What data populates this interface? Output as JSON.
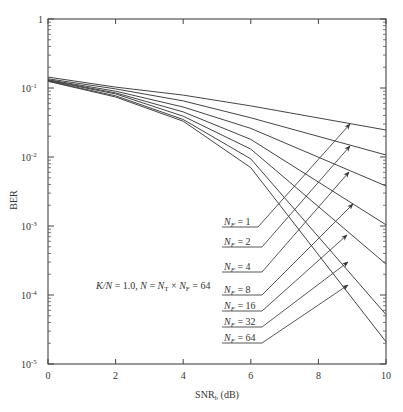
{
  "chart_data": {
    "type": "line",
    "title": "",
    "xlabel": "SNR_b (dB)",
    "xlabel_main": "SNR",
    "xlabel_sub": "b",
    "xlabel_unit": " (dB)",
    "ylabel": "BER",
    "xlim": [
      0,
      10
    ],
    "ylim": [
      1e-05,
      1
    ],
    "yscale": "log",
    "grid": false,
    "x_ticks": [
      0,
      2,
      4,
      6,
      8,
      10
    ],
    "y_ticks": [
      {
        "value": 1,
        "label": "1"
      },
      {
        "value": 0.1,
        "label": "10",
        "exp": "-1"
      },
      {
        "value": 0.01,
        "label": "10",
        "exp": "-2"
      },
      {
        "value": 0.001,
        "label": "10",
        "exp": "-3"
      },
      {
        "value": 0.0001,
        "label": "10",
        "exp": "-4"
      },
      {
        "value": 1e-05,
        "label": "10",
        "exp": "-5"
      }
    ],
    "x": [
      0,
      2,
      4,
      6,
      10
    ],
    "series": [
      {
        "name": "N_F = 1",
        "label": "1",
        "values": [
          0.144,
          0.103,
          0.079,
          0.055,
          0.0246
        ]
      },
      {
        "name": "N_F = 2",
        "label": "2",
        "values": [
          0.136,
          0.097,
          0.065,
          0.037,
          0.0107
        ]
      },
      {
        "name": "N_F = 4",
        "label": "4",
        "values": [
          0.132,
          0.09,
          0.053,
          0.026,
          0.0038
        ]
      },
      {
        "name": "N_F = 8",
        "label": "8",
        "values": [
          0.13,
          0.085,
          0.045,
          0.018,
          0.00104
        ]
      },
      {
        "name": "N_F = 16",
        "label": "16",
        "values": [
          0.128,
          0.082,
          0.039,
          0.013,
          0.00028
        ]
      },
      {
        "name": "N_F = 32",
        "label": "32",
        "values": [
          0.126,
          0.077,
          0.035,
          0.0094,
          5.2e-05
        ]
      },
      {
        "name": "N_F = 64",
        "label": "64",
        "values": [
          0.125,
          0.074,
          0.033,
          0.007,
          2.1e-05
        ]
      }
    ],
    "annotation": "K/N = 1.0, N = N_T × N_F = 64",
    "annotation_parts": {
      "a": "K/N",
      "b": " = 1.0, ",
      "c": "N",
      "d": " = ",
      "e": "N",
      "f": "T",
      "g": " × ",
      "h": "N",
      "i": "F",
      "j": " = 64"
    },
    "legend_position": "inline-annotated-arrows"
  }
}
